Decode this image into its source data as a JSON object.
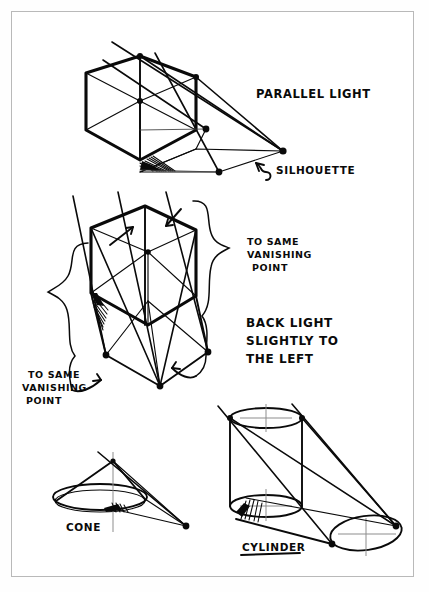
{
  "page": {
    "background_color": "#ffffff",
    "border_color": "#b9b9b9",
    "ink_color": "#0a0a0a"
  },
  "annotations": {
    "parallel_light": "PARALLEL LIGHT",
    "silhouette": "SILHOUETTE",
    "to_same_vanishing_point_right": "TO SAME\nVANISHING\nPOINT",
    "to_same_vanishing_point_right_line1": "TO SAME",
    "to_same_vanishing_point_right_line2": "VANISHING",
    "to_same_vanishing_point_right_line3": "POINT",
    "back_light_line1": "BACK LIGHT",
    "back_light_line2": "SLIGHTLY TO",
    "back_light_line3": "THE LEFT",
    "to_same_vanishing_point_left_line1": "TO SAME",
    "to_same_vanishing_point_left_line2": "VANISHING",
    "to_same_vanishing_point_left_line3": "POINT",
    "cone": "CONE",
    "cylinder": "CYLINDER"
  },
  "figures": [
    {
      "id": "figure-parallel-light-cube",
      "name": "cube-with-parallel-light-shadow",
      "caption": "PARALLEL LIGHT",
      "callout": "SILHOUETTE",
      "light_type": "parallel",
      "light_direction": "upper-left to lower-right",
      "vanishing_point": {
        "x": 283,
        "y": 151
      },
      "ray_count": 3,
      "shadow_vertex_dots": 3
    },
    {
      "id": "figure-back-light-cube",
      "name": "cube-with-back-light-shadow",
      "caption": "BACK LIGHT SLIGHTLY TO THE LEFT",
      "callout_right": "TO SAME VANISHING POINT",
      "callout_left": "TO SAME VANISHING POINT",
      "light_type": "back light",
      "light_direction": "behind, slightly to the left",
      "ray_count": 3,
      "shadow_vertex_dots": 3
    },
    {
      "id": "figure-cone",
      "name": "cone-with-cast-shadow",
      "caption": "CONE",
      "shadow_vertex_dots": 1
    },
    {
      "id": "figure-cylinder",
      "name": "cylinder-with-cast-shadow",
      "caption": "CYLINDER",
      "shadow_vertex_dots": 3
    }
  ]
}
